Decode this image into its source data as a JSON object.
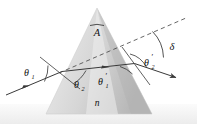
{
  "figure": {
    "type": "optics-ray-diagram",
    "background_color": "#ffffff",
    "canvas": {
      "width": 197,
      "height": 124
    }
  },
  "labels": {
    "apex_angle": "A",
    "refractive_index": "n",
    "incidence_angle": "θ",
    "incidence_angle_sub": "1",
    "internal_refraction_angle": "θ",
    "internal_refraction_angle_sub": "2",
    "internal_incidence_angle": "θ",
    "internal_incidence_angle_sub": "1",
    "internal_incidence_angle_prime": "′",
    "exit_angle": "θ",
    "exit_angle_sub": "2",
    "exit_angle_prime": "′",
    "deviation_angle": "δ"
  },
  "colors": {
    "prism_light": "#e9e9e9",
    "prism_mid": "#d4d4d4",
    "prism_dark": "#bdbdbd",
    "ray_stroke": "#3a3a3a",
    "dashed_stroke": "#4a4a4a",
    "text": "#111111",
    "bottom_band": "#f0f0f0"
  },
  "geometry": {
    "prism": {
      "apex": [
        97,
        8
      ],
      "bottom_left": [
        46,
        114
      ],
      "bottom_right": [
        152,
        114
      ]
    },
    "incident_ray": {
      "from": [
        6,
        94
      ],
      "to": [
        62,
        71
      ]
    },
    "internal_ray": {
      "from": [
        62,
        71
      ],
      "to": [
        134,
        63
      ]
    },
    "exit_ray": {
      "from": [
        134,
        63
      ],
      "to": [
        178,
        78
      ]
    },
    "dashed_extension": {
      "from": [
        60,
        72
      ],
      "to": [
        186,
        18
      ]
    },
    "normal_left": {
      "from": [
        40,
        58
      ],
      "to": [
        80,
        88
      ]
    },
    "normal_right": {
      "from": [
        121,
        48
      ],
      "to": [
        151,
        84
      ]
    }
  },
  "annotations": {
    "apex_arc": "arc above A marking prism apex angle",
    "delta_arc": "arc between dashed extension and exit ray",
    "theta1_arc": "arc between incident ray and left normal",
    "theta2_arc": "arc between left normal and internal ray",
    "theta1p_arc": "arc between internal ray and right normal",
    "theta2p_arc": "arc between right normal and exit ray"
  }
}
